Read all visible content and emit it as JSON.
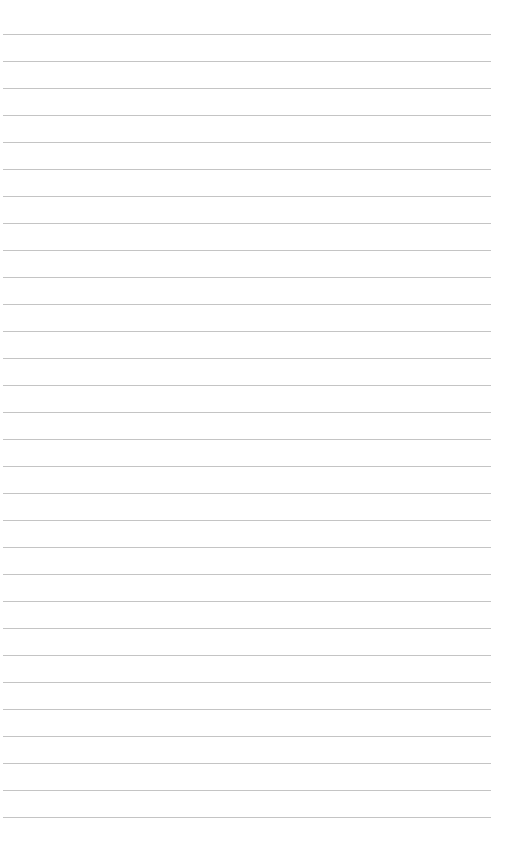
{
  "page": {
    "type": "lined-paper",
    "background_color": "#ffffff",
    "line_color": "#c4c4c4",
    "line_count": 30,
    "first_line_y": 34,
    "line_spacing": 27,
    "line_left": 3,
    "line_width": 488
  }
}
